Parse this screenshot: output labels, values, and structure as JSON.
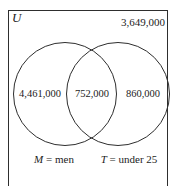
{
  "diagram": {
    "type": "venn",
    "universe_label": "U",
    "outside_value": "3,649,000",
    "left_only_value": "4,461,000",
    "intersection_value": "752,000",
    "right_only_value": "860,000",
    "sets": [
      {
        "symbol": "M",
        "definition": "= men"
      },
      {
        "symbol": "T",
        "definition": "= under 25"
      }
    ],
    "colors": {
      "line": "#2e2e2e",
      "text": "#1c1c1c",
      "background": "#ffffff"
    }
  }
}
